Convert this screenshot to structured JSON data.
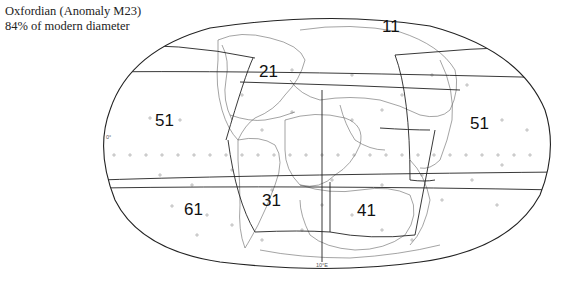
{
  "caption": {
    "line1": "Oxfordian (Anomaly M23)",
    "line2": "84% of modern diameter"
  },
  "map": {
    "projection": "Robinson-style world outline",
    "equator_label": "0°",
    "meridian_label": "10°E",
    "regions": [
      {
        "id": "11",
        "label": "11"
      },
      {
        "id": "21",
        "label": "21"
      },
      {
        "id": "31",
        "label": "31"
      },
      {
        "id": "41",
        "label": "41"
      },
      {
        "id": "51-west",
        "label": "51"
      },
      {
        "id": "51-east",
        "label": "51"
      },
      {
        "id": "61",
        "label": "61"
      }
    ]
  }
}
